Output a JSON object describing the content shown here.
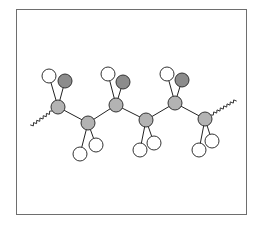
{
  "diagram": {
    "title": "",
    "colors": {
      "frame": "#6e6e6e",
      "carbon": "#b3b3b3",
      "chlorine": "#8c8c8c",
      "hydrogen": "#ffffff",
      "bond": "#222222",
      "outline": "#333333"
    },
    "radii": {
      "carbon": 7,
      "chlorine": 7,
      "hydrogen": 7
    },
    "backbone": [
      {
        "id": "C1",
        "x": 58,
        "y": 107
      },
      {
        "id": "C2",
        "x": 88,
        "y": 123
      },
      {
        "id": "C3",
        "x": 116,
        "y": 105
      },
      {
        "id": "C4",
        "x": 146,
        "y": 120
      },
      {
        "id": "C5",
        "x": 175,
        "y": 103
      },
      {
        "id": "C6",
        "x": 205,
        "y": 119
      }
    ],
    "chain_ends": [
      {
        "from": [
          52,
          111
        ],
        "to": [
          31,
          126
        ]
      },
      {
        "from": [
          211,
          115
        ],
        "to": [
          236,
          100
        ]
      }
    ],
    "substituents": [
      {
        "parent": "C1",
        "type": "hydrogen",
        "x": 49,
        "y": 76
      },
      {
        "parent": "C1",
        "type": "chlorine",
        "x": 65,
        "y": 81
      },
      {
        "parent": "C2",
        "type": "hydrogen",
        "x": 80,
        "y": 154
      },
      {
        "parent": "C2",
        "type": "hydrogen",
        "x": 96,
        "y": 145
      },
      {
        "parent": "C3",
        "type": "hydrogen",
        "x": 108,
        "y": 74
      },
      {
        "parent": "C3",
        "type": "chlorine",
        "x": 123,
        "y": 82
      },
      {
        "parent": "C4",
        "type": "hydrogen",
        "x": 140,
        "y": 150
      },
      {
        "parent": "C4",
        "type": "hydrogen",
        "x": 154,
        "y": 143
      },
      {
        "parent": "C5",
        "type": "hydrogen",
        "x": 167,
        "y": 74
      },
      {
        "parent": "C5",
        "type": "chlorine",
        "x": 182,
        "y": 80
      },
      {
        "parent": "C6",
        "type": "hydrogen",
        "x": 199,
        "y": 150
      },
      {
        "parent": "C6",
        "type": "hydrogen",
        "x": 212,
        "y": 141
      }
    ]
  }
}
